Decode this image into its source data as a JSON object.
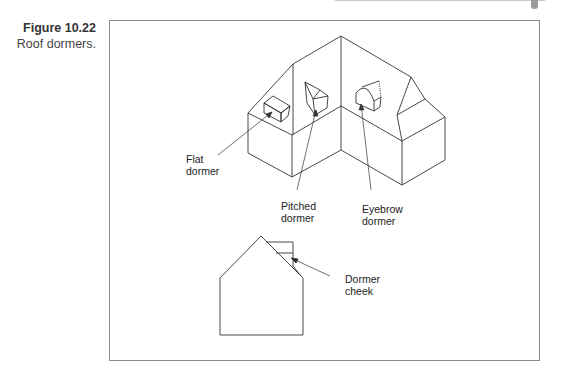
{
  "figure": {
    "number": "Figure 10.22",
    "caption": "Roof dormers."
  },
  "labels": {
    "flat_dormer": [
      "Flat",
      "dormer"
    ],
    "pitched_dormer": [
      "Pitched",
      "dormer"
    ],
    "eyebrow_dormer": [
      "Eyebrow",
      "dormer"
    ],
    "dormer_cheek": [
      "Dormer",
      "cheek"
    ]
  },
  "colors": {
    "line": "#333333",
    "frame": "#8c8c8c"
  }
}
